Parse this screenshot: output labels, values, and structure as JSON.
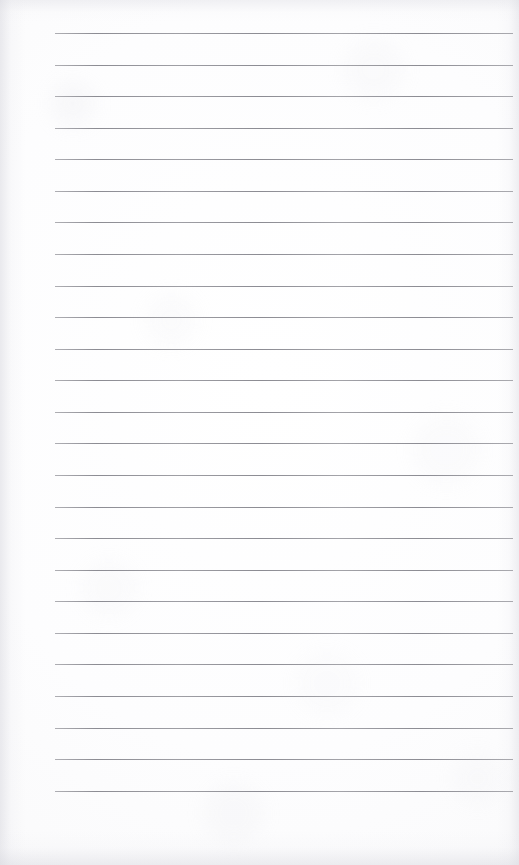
{
  "page": {
    "name": "lined-notebook-page",
    "kind": "scanned-ruled-paper",
    "width": 519,
    "height": 865,
    "background_color": "#fbfbfc",
    "text_content": "",
    "is_blank": true
  },
  "ruling": {
    "line_color": "#8c8c93",
    "line_thickness_px": 1,
    "line_count": 25,
    "first_line_y": 33,
    "line_spacing_px": 31.6,
    "line_start_x": 55,
    "line_end_x": 513,
    "left_margin_px": 55,
    "right_margin_px": 6,
    "top_margin_px": 33,
    "bottom_margin_px": 74,
    "lines": [
      {
        "index": 1,
        "y": 33,
        "x1": 55,
        "x2": 513
      },
      {
        "index": 2,
        "y": 65,
        "x1": 55,
        "x2": 513
      },
      {
        "index": 3,
        "y": 96,
        "x1": 55,
        "x2": 513
      },
      {
        "index": 4,
        "y": 128,
        "x1": 55,
        "x2": 513
      },
      {
        "index": 5,
        "y": 159,
        "x1": 55,
        "x2": 513
      },
      {
        "index": 6,
        "y": 191,
        "x1": 55,
        "x2": 513
      },
      {
        "index": 7,
        "y": 222,
        "x1": 55,
        "x2": 513
      },
      {
        "index": 8,
        "y": 254,
        "x1": 55,
        "x2": 513
      },
      {
        "index": 9,
        "y": 286,
        "x1": 55,
        "x2": 513
      },
      {
        "index": 10,
        "y": 317,
        "x1": 55,
        "x2": 513
      },
      {
        "index": 11,
        "y": 349,
        "x1": 55,
        "x2": 513
      },
      {
        "index": 12,
        "y": 380,
        "x1": 55,
        "x2": 513
      },
      {
        "index": 13,
        "y": 412,
        "x1": 55,
        "x2": 513
      },
      {
        "index": 14,
        "y": 443,
        "x1": 55,
        "x2": 513
      },
      {
        "index": 15,
        "y": 475,
        "x1": 55,
        "x2": 513
      },
      {
        "index": 16,
        "y": 507,
        "x1": 55,
        "x2": 513
      },
      {
        "index": 17,
        "y": 538,
        "x1": 55,
        "x2": 513
      },
      {
        "index": 18,
        "y": 570,
        "x1": 55,
        "x2": 513
      },
      {
        "index": 19,
        "y": 601,
        "x1": 55,
        "x2": 513
      },
      {
        "index": 20,
        "y": 633,
        "x1": 55,
        "x2": 513
      },
      {
        "index": 21,
        "y": 664,
        "x1": 55,
        "x2": 513
      },
      {
        "index": 22,
        "y": 696,
        "x1": 55,
        "x2": 513
      },
      {
        "index": 23,
        "y": 728,
        "x1": 55,
        "x2": 513
      },
      {
        "index": 24,
        "y": 759,
        "x1": 55,
        "x2": 513
      },
      {
        "index": 25,
        "y": 791,
        "x1": 55,
        "x2": 513
      }
    ]
  }
}
